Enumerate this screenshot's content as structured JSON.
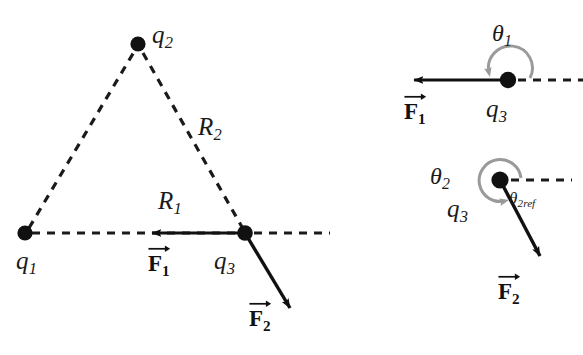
{
  "figure": {
    "background_color": "#ffffff",
    "stroke_color": "#111111",
    "arc_color": "#8c8c8c",
    "dash_color": "#1a1a1a"
  },
  "left_panel": {
    "name": "charge-triangle-diagram",
    "charges": [
      {
        "id": "q1",
        "label": "q",
        "sub": "1",
        "x": 25,
        "y": 233,
        "label_x": 16,
        "label_y": 248
      },
      {
        "id": "q2",
        "label": "q",
        "sub": "2",
        "x": 138,
        "y": 44,
        "label_x": 152,
        "label_y": 22
      },
      {
        "id": "q3",
        "label": "q",
        "sub": "3",
        "x": 245,
        "y": 233,
        "label_x": 214,
        "label_y": 248
      }
    ],
    "distance_labels": [
      {
        "id": "R1",
        "label": "R",
        "sub": "1",
        "x": 158,
        "y": 188
      },
      {
        "id": "R2",
        "label": "R",
        "sub": "2",
        "x": 198,
        "y": 114
      }
    ],
    "force_labels": [
      {
        "id": "F1",
        "label": "F",
        "sub": "1",
        "x": 148,
        "y": 250
      },
      {
        "id": "F2",
        "label": "F",
        "sub": "2",
        "x": 249,
        "y": 305
      }
    ],
    "vectors": [
      {
        "id": "F1",
        "from_x": 245,
        "from_y": 233,
        "to_x": 144,
        "to_y": 233
      },
      {
        "id": "F2",
        "from_x": 245,
        "from_y": 233,
        "to_x": 296,
        "to_y": 315
      }
    ]
  },
  "right_panel_top": {
    "name": "theta1-angle-diagram",
    "charge": {
      "label": "q",
      "sub": "3",
      "x": 508,
      "y": 80,
      "label_x": 486,
      "label_y": 96
    },
    "angle_label": {
      "label": "θ",
      "sub": "1",
      "x": 492,
      "y": 21
    },
    "force_label": {
      "label": "F",
      "sub": "1",
      "x": 404,
      "y": 98
    },
    "vector": {
      "from_x": 508,
      "from_y": 80,
      "to_x": 406,
      "to_y": 80
    },
    "reference_line": {
      "from_x": 516,
      "from_y": 80,
      "to_x": 583,
      "to_y": 80
    }
  },
  "right_panel_bottom": {
    "name": "theta2-angle-diagram",
    "charge": {
      "label": "q",
      "sub": "3",
      "x": 500,
      "y": 180,
      "label_x": 447,
      "label_y": 196
    },
    "angle_label": {
      "label": "θ",
      "sub": "2",
      "x": 430,
      "y": 164
    },
    "reference_angle_label": {
      "label": "θ",
      "sub": "2ref",
      "x": 509,
      "y": 190
    },
    "force_label": {
      "label": "F",
      "sub": "2",
      "x": 498,
      "y": 278
    },
    "vector": {
      "from_x": 500,
      "from_y": 180,
      "to_x": 546,
      "to_y": 266
    },
    "reference_line": {
      "from_x": 508,
      "from_y": 180,
      "to_x": 572,
      "to_y": 180
    }
  }
}
